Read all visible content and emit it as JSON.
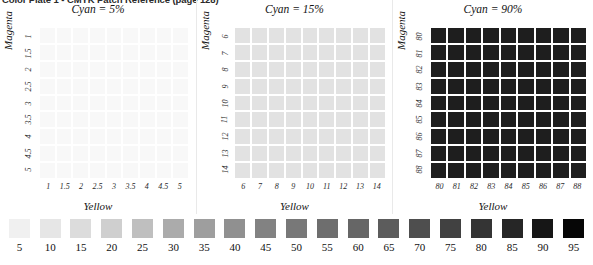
{
  "page_header": "Color Plate 1 - CMYK Patch Reference (page 128)",
  "panels": [
    {
      "title": "Cyan = 5%",
      "cyan_percent": 5,
      "y_axis_label": "Magenta",
      "x_axis_label": "Yellow",
      "y_ticks": [
        "1",
        "1.5",
        "2",
        "2.5",
        "3",
        "3.5",
        "4",
        "4.5",
        "5"
      ],
      "x_ticks": [
        "1",
        "1.5",
        "2",
        "2.5",
        "3",
        "3.5",
        "4",
        "4.5",
        "5"
      ],
      "patch_color": "#f8f8f8"
    },
    {
      "title": "Cyan = 15%",
      "cyan_percent": 15,
      "y_axis_label": "Magenta",
      "x_axis_label": "Yellow",
      "y_ticks": [
        "6",
        "7",
        "8",
        "9",
        "10",
        "11",
        "12",
        "13",
        "14"
      ],
      "x_ticks": [
        "6",
        "7",
        "8",
        "9",
        "10",
        "11",
        "12",
        "13",
        "14"
      ],
      "patch_color": "#e2e2e2"
    },
    {
      "title": "Cyan = 90%",
      "cyan_percent": 90,
      "y_axis_label": "Magenta",
      "x_axis_label": "Yellow",
      "y_ticks": [
        "80",
        "81",
        "82",
        "83",
        "84",
        "85",
        "86",
        "87",
        "88"
      ],
      "x_ticks": [
        "80",
        "81",
        "82",
        "83",
        "84",
        "85",
        "86",
        "87",
        "88"
      ],
      "patch_color": "#1e1e1e"
    }
  ],
  "gray_wedge": {
    "labels": [
      "5",
      "10",
      "15",
      "20",
      "25",
      "30",
      "35",
      "40",
      "45",
      "50",
      "55",
      "60",
      "65",
      "70",
      "75",
      "80",
      "85",
      "90",
      "95"
    ],
    "values": [
      5,
      10,
      15,
      20,
      25,
      30,
      35,
      40,
      45,
      50,
      55,
      60,
      65,
      70,
      75,
      80,
      85,
      90,
      95
    ],
    "colors": [
      "#f0f0f0",
      "#e6e6e6",
      "#dcdcdc",
      "#cfcfcf",
      "#bfbfbf",
      "#ababab",
      "#9e9e9e",
      "#909090",
      "#828282",
      "#787878",
      "#6e6e6e",
      "#666666",
      "#5c5c5c",
      "#4e4e4e",
      "#414141",
      "#343434",
      "#262626",
      "#161616",
      "#060606"
    ]
  },
  "chart_data": {
    "type": "heatmap",
    "xlabel": "Yellow",
    "ylabel": "Magenta",
    "grid": false,
    "legend_position": "bottom",
    "panels": [
      {
        "name": "Cyan = 5%",
        "x": [
          1,
          1.5,
          2,
          2.5,
          3,
          3.5,
          4,
          4.5,
          5
        ],
        "y": [
          1,
          1.5,
          2,
          2.5,
          3,
          3.5,
          4,
          4.5,
          5
        ],
        "cell_gray_level": 97,
        "cell_hex": "#f8f8f8"
      },
      {
        "name": "Cyan = 15%",
        "x": [
          6,
          7,
          8,
          9,
          10,
          11,
          12,
          13,
          14
        ],
        "y": [
          6,
          7,
          8,
          9,
          10,
          11,
          12,
          13,
          14
        ],
        "cell_gray_level": 89,
        "cell_hex": "#e2e2e2"
      },
      {
        "name": "Cyan = 90%",
        "x": [
          80,
          81,
          82,
          83,
          84,
          85,
          86,
          87,
          88
        ],
        "y": [
          80,
          81,
          82,
          83,
          84,
          85,
          86,
          87,
          88
        ],
        "cell_gray_level": 12,
        "cell_hex": "#1e1e1e"
      }
    ],
    "legend_scale": {
      "name": "Gray step wedge (percent dot area)",
      "ticks": [
        5,
        10,
        15,
        20,
        25,
        30,
        35,
        40,
        45,
        50,
        55,
        60,
        65,
        70,
        75,
        80,
        85,
        90,
        95
      ],
      "colors": [
        "#f0f0f0",
        "#e6e6e6",
        "#dcdcdc",
        "#cfcfcf",
        "#bfbfbf",
        "#ababab",
        "#9e9e9e",
        "#909090",
        "#828282",
        "#787878",
        "#6e6e6e",
        "#666666",
        "#5c5c5c",
        "#4e4e4e",
        "#414141",
        "#343434",
        "#262626",
        "#161616",
        "#060606"
      ]
    }
  }
}
